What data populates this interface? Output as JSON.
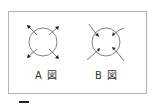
{
  "figures": [
    {
      "id": "A",
      "label": "A 図",
      "arrow_direction": "outward"
    },
    {
      "id": "B",
      "label": "B 図",
      "arrow_direction": "inward"
    }
  ],
  "colors": {
    "line": "#555555",
    "frame": "#b5b5b5",
    "text": "#333333"
  }
}
